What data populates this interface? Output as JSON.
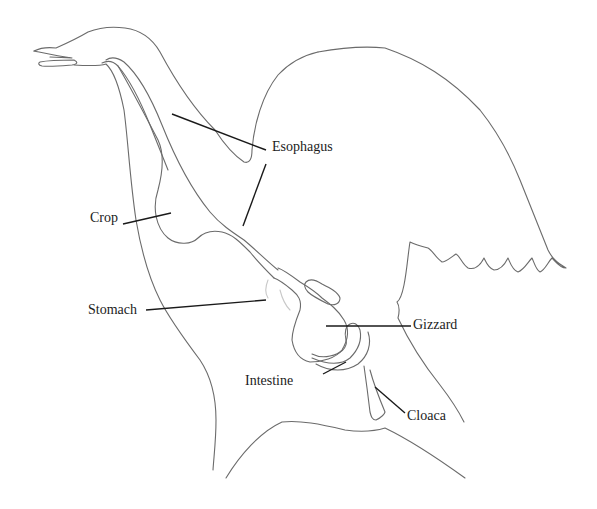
{
  "diagram": {
    "labels": {
      "esophagus": "Esophagus",
      "crop": "Crop",
      "stomach": "Stomach",
      "gizzard": "Gizzard",
      "intestine": "Intestine",
      "cloaca": "Cloaca"
    },
    "colors": {
      "outline": "#6b6b6b",
      "leader": "#1a1a1a",
      "text": "#1c1c1c",
      "background": "#ffffff"
    }
  }
}
